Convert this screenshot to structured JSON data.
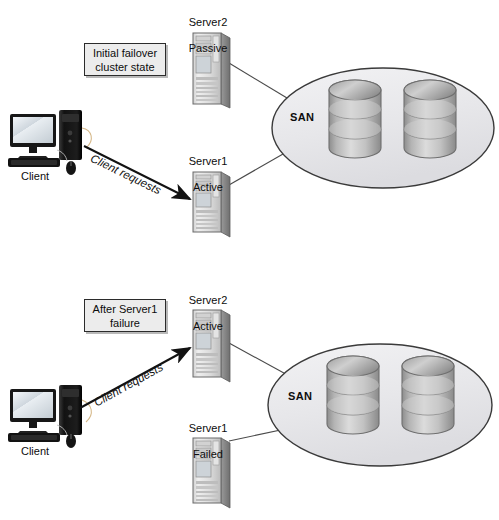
{
  "diagram": {
    "palette": {
      "line": "#2b2b2b",
      "callout_bg": "#ececec",
      "callout_border": "#2b2b2b",
      "san_fill": "#e9e9ec",
      "san_stroke": "#3a3a3a",
      "disk_fill": "#bfbfbf",
      "disk_stroke": "#6f6f6f",
      "server_light": "#e3e3e3",
      "server_mid": "#b6b6b6",
      "server_dark": "#8e8e8e",
      "client_dark": "#1b1b1b",
      "screen": "#d7dde2"
    },
    "scenes": [
      {
        "id": "initial",
        "callout": "Initial failover\ncluster state",
        "client_label": "Client",
        "arrow_label": "Client requests",
        "arrow_direction": "down-right",
        "san_label": "SAN",
        "disk_count": 2,
        "platters_per_disk": 3,
        "servers": [
          {
            "id": "top",
            "name": "Server2",
            "state": "Passive"
          },
          {
            "id": "bottom",
            "name": "Server1",
            "state": "Active"
          }
        ]
      },
      {
        "id": "after-failure",
        "callout": "After Server1\nfailure",
        "client_label": "Client",
        "arrow_label": "Client requests",
        "arrow_direction": "up-right",
        "san_label": "SAN",
        "disk_count": 2,
        "platters_per_disk": 3,
        "servers": [
          {
            "id": "top",
            "name": "Server2",
            "state": "Active"
          },
          {
            "id": "bottom",
            "name": "Server1",
            "state": "Failed"
          }
        ]
      }
    ]
  }
}
